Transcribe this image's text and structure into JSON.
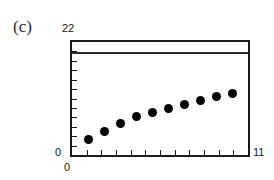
{
  "figure": {
    "panel_label": "(c)",
    "background_color": "#ffffff",
    "frame_color": "#1a1a1a",
    "marker_color": "#000000",
    "reference_line_color": "#2a2a2a"
  },
  "axis_labels": {
    "y_max": "22",
    "y_min": "0",
    "x_min": "0",
    "x_max": "11"
  },
  "chart_data": {
    "type": "scatter",
    "title": "(c)",
    "xlabel": "",
    "ylabel": "",
    "xlim": [
      0,
      11
    ],
    "ylim": [
      0,
      22
    ],
    "grid": false,
    "legend": null,
    "x_tick_labels": [
      "0",
      "11"
    ],
    "y_tick_labels": [
      "0",
      "22"
    ],
    "x_minor_tick_count": 11,
    "y_minor_tick_count": 11,
    "series": [
      {
        "name": "data",
        "marker": "filled-circle",
        "x": [
          1,
          2,
          3,
          4,
          5,
          6,
          7,
          8,
          9,
          10
        ],
        "y": [
          3.0,
          4.5,
          6.2,
          7.4,
          8.3,
          9.0,
          9.8,
          10.6,
          11.3,
          12.0
        ]
      }
    ],
    "annotations": [
      {
        "type": "horizontal-line",
        "name": "reference-line",
        "y": 20.0,
        "x_start": 0,
        "x_end": 11
      }
    ]
  }
}
